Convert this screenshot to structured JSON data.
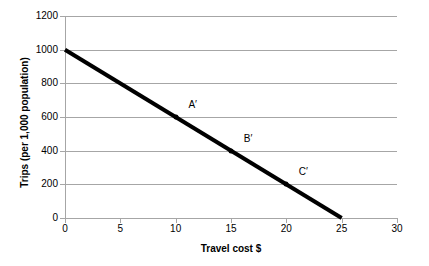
{
  "chart_data": {
    "type": "line",
    "title": "",
    "xlabel": "Travel cost $",
    "ylabel": "Trips (per 1,000 population)",
    "xlim": [
      0,
      30
    ],
    "ylim": [
      0,
      1200
    ],
    "xticks": [
      0,
      5,
      10,
      15,
      20,
      25,
      30
    ],
    "xtick_labels": [
      "0",
      "5",
      "10",
      "15",
      "20",
      "25",
      "30"
    ],
    "yticks": [
      0,
      200,
      400,
      600,
      800,
      1000,
      1200
    ],
    "ytick_labels": [
      "0",
      "200",
      "400",
      "600",
      "800",
      "1000",
      "1200"
    ],
    "grid": "horizontal",
    "legend": "none",
    "series": [
      {
        "name": "Demand curve",
        "color": "#000000",
        "line_width": 4,
        "x": [
          0,
          25
        ],
        "values": [
          1000,
          0
        ]
      }
    ],
    "annotations": [
      {
        "label": "A′",
        "x": 10,
        "y": 600
      },
      {
        "label": "B′",
        "x": 15,
        "y": 400
      },
      {
        "label": "C′",
        "x": 20,
        "y": 200
      }
    ],
    "colors": {
      "line": "#000000",
      "grid": "#a6a6a6",
      "axis": "#a6a6a6",
      "text": "#000000",
      "background": "#ffffff"
    }
  }
}
